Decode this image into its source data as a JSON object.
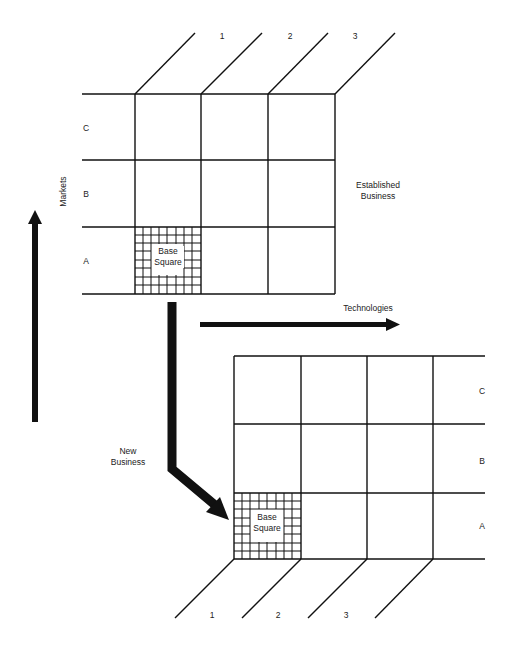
{
  "diagram": {
    "type": "grid-matrix",
    "top_grid": {
      "name": "Established Business",
      "column_labels": [
        "1",
        "2",
        "3"
      ],
      "row_labels": [
        "C",
        "B",
        "A"
      ],
      "base_square_label_line1": "Base",
      "base_square_label_line2": "Square"
    },
    "bottom_grid": {
      "column_labels": [
        "1",
        "2",
        "3"
      ],
      "row_labels": [
        "C",
        "B",
        "A"
      ],
      "base_square_label_line1": "Base",
      "base_square_label_line2": "Square"
    },
    "labels": {
      "established_line1": "Established",
      "established_line2": "Business",
      "new_line1": "New",
      "new_line2": "Business",
      "markets": "Markets",
      "technologies": "Technologies"
    },
    "colors": {
      "line": "#111111",
      "background": "#ffffff",
      "text": "#222222"
    }
  }
}
